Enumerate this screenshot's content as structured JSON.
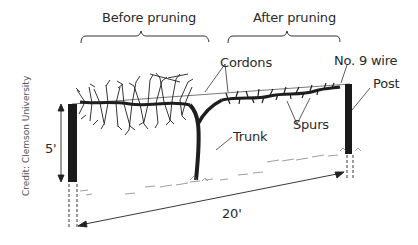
{
  "diagram": {
    "sections": {
      "before": "Before pruning",
      "after": "After pruning"
    },
    "labels": {
      "cordons": "Cordons",
      "wire": "No. 9 wire",
      "post": "Post",
      "spurs": "Spurs",
      "trunk": "Trunk"
    },
    "dimensions": {
      "height": "5'",
      "width": "20'"
    },
    "credit": "Credit: Clemson University",
    "colors": {
      "ink": "#1e1e1e",
      "post": "#1a1a1a",
      "background": "#ffffff",
      "text": "#2a2a2a"
    }
  }
}
